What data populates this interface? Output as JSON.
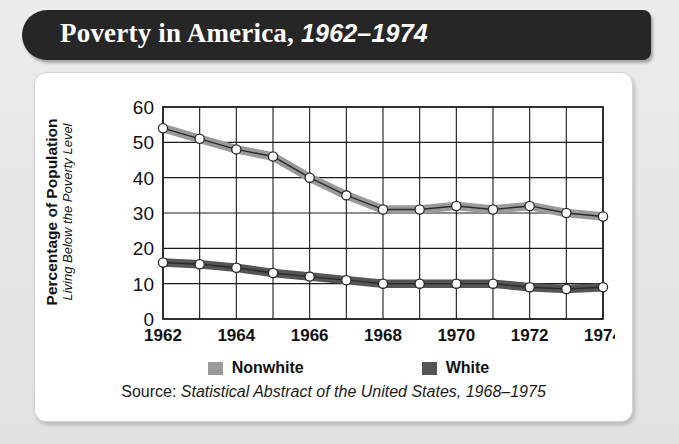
{
  "title": {
    "main": "Poverty in America,",
    "years": "1962–1974"
  },
  "axis": {
    "y_title_main": "Percentage of Population",
    "y_title_sub": "Living Below the Poverty Level",
    "y_ticks": [
      "60",
      "50",
      "40",
      "30",
      "20",
      "10",
      "0"
    ],
    "x_ticks": [
      "1962",
      "1964",
      "1966",
      "1968",
      "1970",
      "1972",
      "1974"
    ]
  },
  "legend": [
    {
      "label": "Nonwhite",
      "color": "#9a9a9a"
    },
    {
      "label": "White",
      "color": "#555555"
    }
  ],
  "source": {
    "label": "Source:",
    "citation": "Statistical Abstract of the United States, 1968–1975"
  },
  "colors": {
    "banner": "#262626",
    "card": "#ffffff",
    "page": "#e9e9e9",
    "grid": "#1a1a1a",
    "nonwhite": "#9a9a9a",
    "white_series": "#555555"
  },
  "chart_data": {
    "type": "line",
    "title": "Poverty in America, 1962–1974",
    "xlabel": "",
    "ylabel": "Percentage of Population Living Below the Poverty Level",
    "x": [
      1962,
      1963,
      1964,
      1965,
      1966,
      1967,
      1968,
      1969,
      1970,
      1971,
      1972,
      1973,
      1974
    ],
    "xlim": [
      1962,
      1974
    ],
    "ylim": [
      0,
      60
    ],
    "yticks": [
      0,
      10,
      20,
      30,
      40,
      50,
      60
    ],
    "xticks": [
      1962,
      1964,
      1966,
      1968,
      1970,
      1972,
      1974
    ],
    "grid": true,
    "legend_position": "bottom",
    "markers": "open-circle",
    "series": [
      {
        "name": "Nonwhite",
        "color": "#9a9a9a",
        "values": [
          54,
          51,
          48,
          46,
          40,
          35,
          31,
          31,
          32,
          31,
          32,
          30,
          29
        ]
      },
      {
        "name": "White",
        "color": "#555555",
        "values": [
          16,
          15.5,
          14.5,
          13,
          12,
          11,
          10,
          10,
          10,
          10,
          9,
          8.5,
          9
        ]
      }
    ]
  }
}
